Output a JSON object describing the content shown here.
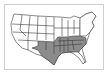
{
  "map": {
    "subject": "United States",
    "shaded_color": "#8c8c8c",
    "unshaded_color": "#ffffff",
    "border_color": "#3a3a3a",
    "frame_color": "#cfcfcf",
    "shaded_states": [
      "TX",
      "OK",
      "AR",
      "LA",
      "MS",
      "AL",
      "TN",
      "KY",
      "GA",
      "SC",
      "NC",
      "VA",
      "WV",
      "MO",
      "FL-panhandle"
    ]
  }
}
